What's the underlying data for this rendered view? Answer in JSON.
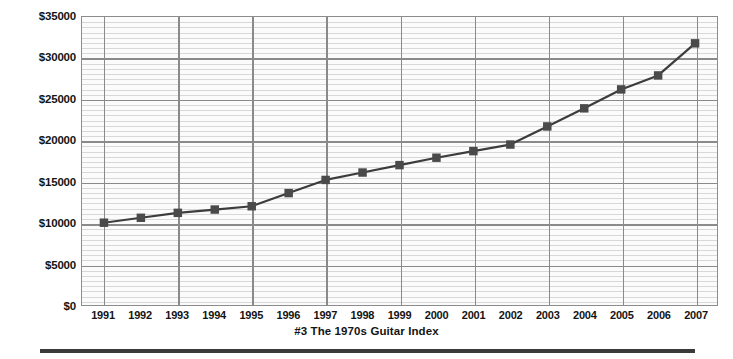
{
  "chart_data": {
    "type": "line",
    "title": "#3  The 1970s Guitar Index",
    "xlabel": "",
    "ylabel": "",
    "categories": [
      "1991",
      "1992",
      "1993",
      "1994",
      "1995",
      "1996",
      "1997",
      "1998",
      "1999",
      "2000",
      "2001",
      "2002",
      "2003",
      "2004",
      "2005",
      "2006",
      "2007"
    ],
    "values": [
      10000,
      10600,
      11200,
      11600,
      12000,
      13600,
      15200,
      16100,
      17000,
      17900,
      18700,
      19500,
      21700,
      23900,
      26200,
      27900,
      31800
    ],
    "series": [
      {
        "name": "The 1970s Guitar Index",
        "values": [
          10000,
          10600,
          11200,
          11600,
          12000,
          13600,
          15200,
          16100,
          17000,
          17900,
          18700,
          19500,
          21700,
          23900,
          26200,
          27900,
          31800
        ]
      }
    ],
    "ylim": [
      0,
      35000
    ],
    "ytick_values": [
      0,
      5000,
      10000,
      15000,
      20000,
      25000,
      30000,
      35000
    ],
    "ytick_labels": [
      "$0",
      "$5000",
      "$10000",
      "$15000",
      "$20000",
      "$25000",
      "$30000",
      "$35000"
    ],
    "yminor_step": 625,
    "grid": true,
    "grid_major_color": "#8a8a8a",
    "grid_minor_color": "#d8d8d8",
    "legend": "none",
    "line_color": "#3c3c3c",
    "marker_color": "#4a4a4a",
    "marker_shape": "square",
    "plot_background": "#fbfbfb",
    "plot_border_color": "#8c8c8c",
    "vertical_gridline_every_n_categories": 2
  },
  "caption": {
    "text": "#3  The 1970s Guitar Index"
  },
  "footer": {
    "rule_color": "#3a3a3a"
  }
}
